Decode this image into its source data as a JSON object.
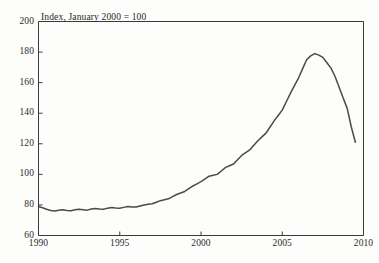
{
  "chart_data": {
    "type": "line",
    "title": "Index, January 2000 = 100",
    "xlabel": "",
    "ylabel": "",
    "xlim": [
      1990,
      2010
    ],
    "ylim": [
      60,
      200
    ],
    "grid": false,
    "legend": false,
    "legend_position": "none",
    "line_color": "#4a4a4a",
    "frame_color": "#3a3a3a",
    "background_color": "#fdfdfb",
    "xticks": [
      1990,
      1995,
      2000,
      2005,
      2010
    ],
    "xtick_labels": [
      "1990",
      "1995",
      "2000",
      "2005",
      "2010"
    ],
    "yticks": [
      60,
      80,
      100,
      120,
      140,
      160,
      180,
      200
    ],
    "ytick_labels": [
      "60",
      "80",
      "100",
      "120",
      "140",
      "160",
      "180",
      "200"
    ],
    "series": [
      {
        "name": "Index",
        "x": [
          1990.0,
          1990.25,
          1990.5,
          1990.75,
          1991.0,
          1991.25,
          1991.5,
          1991.75,
          1992.0,
          1992.25,
          1992.5,
          1992.75,
          1993.0,
          1993.25,
          1993.5,
          1993.75,
          1994.0,
          1994.25,
          1994.5,
          1994.75,
          1995.0,
          1995.25,
          1995.5,
          1995.75,
          1996.0,
          1996.25,
          1996.5,
          1996.75,
          1997.0,
          1997.25,
          1997.5,
          1997.75,
          1998.0,
          1998.25,
          1998.5,
          1998.75,
          1999.0,
          1999.25,
          1999.5,
          1999.75,
          2000.0,
          2000.25,
          2000.5,
          2000.75,
          2001.0,
          2001.25,
          2001.5,
          2001.75,
          2002.0,
          2002.25,
          2002.5,
          2002.75,
          2003.0,
          2003.25,
          2003.5,
          2003.75,
          2004.0,
          2004.25,
          2004.5,
          2004.75,
          2005.0,
          2005.25,
          2005.5,
          2005.75,
          2006.0,
          2006.25,
          2006.5,
          2006.75,
          2007.0,
          2007.25,
          2007.5,
          2007.75,
          2008.0,
          2008.25,
          2008.5,
          2008.75,
          2009.0,
          2009.25,
          2009.5
        ],
        "values": [
          79.0,
          78.2,
          77.2,
          76.4,
          76.0,
          76.5,
          76.8,
          76.4,
          76.2,
          76.8,
          77.2,
          76.9,
          76.6,
          77.3,
          77.7,
          77.4,
          77.2,
          77.9,
          78.3,
          78.0,
          77.8,
          78.4,
          78.9,
          78.7,
          78.6,
          79.3,
          80.0,
          80.4,
          80.8,
          81.8,
          82.8,
          83.4,
          84.0,
          85.4,
          86.8,
          87.8,
          88.8,
          90.6,
          92.4,
          93.8,
          95.2,
          97.0,
          98.8,
          99.4,
          100.0,
          102.2,
          104.4,
          105.6,
          106.8,
          109.6,
          112.4,
          114.2,
          116.0,
          119.0,
          122.0,
          124.5,
          127.0,
          131.0,
          135.0,
          138.5,
          142.0,
          147.5,
          153.0,
          158.0,
          163.0,
          169.0,
          175.0,
          177.5,
          179.0,
          178.0,
          176.5,
          173.0,
          169.5,
          164.0,
          157.0,
          150.0,
          143.0,
          131.0,
          121.0
        ]
      }
    ],
    "annotations": {
      "peak_year": 2007.0,
      "peak_value": 179.0,
      "start_value": 79.0,
      "end_value": 121.0
    }
  }
}
